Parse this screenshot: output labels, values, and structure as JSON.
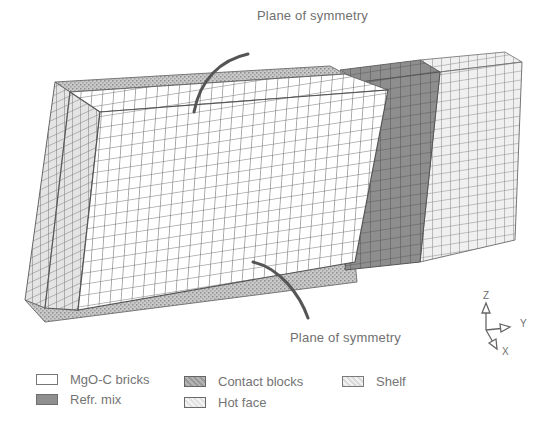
{
  "figure": {
    "callouts": {
      "top": "Plane of symmetry",
      "bottom": "Plane of symmetry"
    },
    "axes": {
      "z": "Z",
      "y": "Y",
      "x": "X"
    },
    "regions": [
      {
        "name": "MgO-C bricks",
        "fill": "#ffffff"
      },
      {
        "name": "Refr. mix",
        "fill": "#8f8f8f"
      },
      {
        "name": "Contact blocks",
        "fill": "#a8a8a8"
      },
      {
        "name": "Hot face",
        "fill": "#ececec"
      },
      {
        "name": "Shelf",
        "fill": "#d8d8d8"
      }
    ]
  },
  "legend": {
    "items": [
      {
        "label": "MgO-C bricks",
        "swatch": "white"
      },
      {
        "label": "Refr. mix",
        "swatch": "dark-gray"
      },
      {
        "label": "Contact blocks",
        "swatch": "hatched-gray"
      },
      {
        "label": "Hot face",
        "swatch": "hatched-light"
      },
      {
        "label": "Shelf",
        "swatch": "hatched-light"
      }
    ]
  }
}
